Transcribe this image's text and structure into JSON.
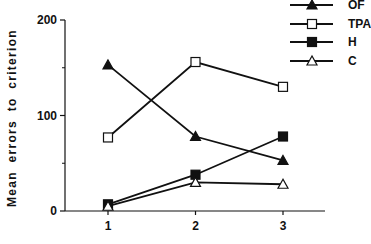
{
  "chart_data": {
    "type": "line",
    "title": "",
    "xlabel": "",
    "ylabel": "Mean errors to criterion",
    "x": [
      1,
      2,
      3
    ],
    "xticks": [
      "1",
      "2",
      "3"
    ],
    "yticks": [
      "0",
      "100",
      "200"
    ],
    "ylim": [
      0,
      200
    ],
    "minor_yticks": [
      50,
      150
    ],
    "grid": false,
    "legend_position": "top-right",
    "series": [
      {
        "name": "OF",
        "marker": "filled-triangle",
        "values": [
          153,
          78,
          53
        ]
      },
      {
        "name": "TPA",
        "marker": "open-square",
        "values": [
          77,
          156,
          130
        ]
      },
      {
        "name": "H",
        "marker": "filled-square",
        "values": [
          7,
          38,
          78
        ]
      },
      {
        "name": "C",
        "marker": "open-triangle",
        "values": [
          5,
          30,
          28
        ]
      }
    ]
  },
  "colors": {
    "line": "#111111",
    "background": "#ffffff"
  }
}
